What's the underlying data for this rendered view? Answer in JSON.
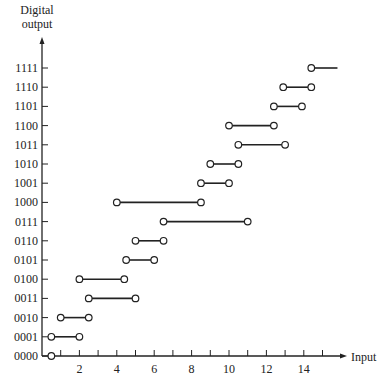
{
  "chart_data": {
    "type": "line",
    "title": "",
    "xlabel": "Input",
    "ylabel": "Digital output",
    "xlim": [
      0,
      16
    ],
    "x_tick_labels": [
      "2",
      "4",
      "6",
      "8",
      "10",
      "12",
      "14"
    ],
    "x_tick_values": [
      2,
      4,
      6,
      8,
      10,
      12,
      14
    ],
    "minor_ticks": [
      1,
      2,
      3,
      4,
      5,
      6,
      7,
      8,
      9,
      10,
      11,
      12,
      13,
      14,
      15
    ],
    "y_categories": [
      "0000",
      "0001",
      "0010",
      "0011",
      "0100",
      "0101",
      "0110",
      "0111",
      "1000",
      "1001",
      "1010",
      "1011",
      "1100",
      "1101",
      "1110",
      "1111"
    ],
    "grid": false,
    "legend": null,
    "segments": [
      {
        "code": "0000",
        "x_start": 0.5,
        "x_end": 0.5,
        "start_marker": "open-circle",
        "end_marker": "none"
      },
      {
        "code": "0001",
        "x_start": 0.5,
        "x_end": 2.0,
        "start_marker": "open-circle",
        "end_marker": "open-circle"
      },
      {
        "code": "0010",
        "x_start": 1.0,
        "x_end": 2.5,
        "start_marker": "open-circle",
        "end_marker": "open-circle"
      },
      {
        "code": "0011",
        "x_start": 2.5,
        "x_end": 5.0,
        "start_marker": "open-circle",
        "end_marker": "open-circle"
      },
      {
        "code": "0100",
        "x_start": 2.0,
        "x_end": 4.4,
        "start_marker": "open-circle",
        "end_marker": "open-circle"
      },
      {
        "code": "0101",
        "x_start": 4.5,
        "x_end": 6.0,
        "start_marker": "open-circle",
        "end_marker": "open-circle"
      },
      {
        "code": "0110",
        "x_start": 5.0,
        "x_end": 6.5,
        "start_marker": "open-circle",
        "end_marker": "open-circle"
      },
      {
        "code": "0111",
        "x_start": 6.5,
        "x_end": 11.0,
        "start_marker": "open-circle",
        "end_marker": "open-circle"
      },
      {
        "code": "1000",
        "x_start": 4.0,
        "x_end": 8.5,
        "start_marker": "open-circle",
        "end_marker": "open-circle"
      },
      {
        "code": "1001",
        "x_start": 8.5,
        "x_end": 10.0,
        "start_marker": "open-circle",
        "end_marker": "open-circle"
      },
      {
        "code": "1010",
        "x_start": 9.0,
        "x_end": 10.5,
        "start_marker": "open-circle",
        "end_marker": "open-circle"
      },
      {
        "code": "1011",
        "x_start": 10.5,
        "x_end": 13.0,
        "start_marker": "open-circle",
        "end_marker": "open-circle"
      },
      {
        "code": "1100",
        "x_start": 10.0,
        "x_end": 12.4,
        "start_marker": "open-circle",
        "end_marker": "open-circle"
      },
      {
        "code": "1101",
        "x_start": 12.4,
        "x_end": 13.9,
        "start_marker": "open-circle",
        "end_marker": "open-circle"
      },
      {
        "code": "1110",
        "x_start": 12.9,
        "x_end": 14.4,
        "start_marker": "open-circle",
        "end_marker": "open-circle"
      },
      {
        "code": "1111",
        "x_start": 14.4,
        "x_end": 15.8,
        "start_marker": "open-circle",
        "end_marker": "none"
      }
    ]
  },
  "labels": {
    "y_title_line1": "Digital",
    "y_title_line2": "output",
    "x_title": "Input"
  },
  "colors": {
    "ink": "#222222",
    "background": "#ffffff"
  }
}
